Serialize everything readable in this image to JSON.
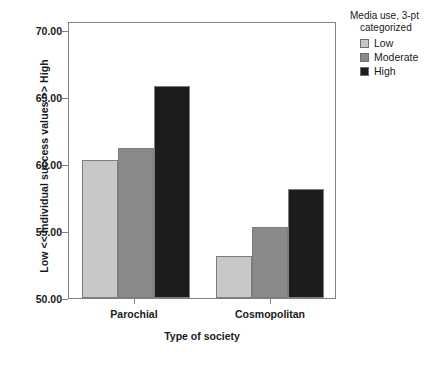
{
  "chart_data": {
    "type": "bar",
    "title": "",
    "xlabel": "Type of society",
    "ylabel": "Low << Individual success values >> High",
    "categories": [
      "Parochial",
      "Cosmopolitan"
    ],
    "series": [
      {
        "name": "Low",
        "values": [
          60.0,
          53.0
        ],
        "color": "#c8c8c8"
      },
      {
        "name": "Moderate",
        "values": [
          60.8,
          55.1
        ],
        "color": "#8a8a8a"
      },
      {
        "name": "High",
        "values": [
          65.3,
          57.9
        ],
        "color": "#1c1c1c"
      }
    ],
    "ylim": [
      50.0,
      70.0
    ],
    "yticks": [
      "50.00",
      "55.00",
      "60.00",
      "65.00",
      "70.00"
    ],
    "ytick_values": [
      50.0,
      55.0,
      60.0,
      65.0,
      70.0
    ],
    "grid": false,
    "legend_position": "right"
  },
  "legend": {
    "title_line1": "Media use, 3-pt",
    "title_line2": "categorized",
    "entries": [
      {
        "label": "Low",
        "color": "#c8c8c8"
      },
      {
        "label": "Moderate",
        "color": "#8a8a8a"
      },
      {
        "label": "High",
        "color": "#1c1c1c"
      }
    ]
  }
}
